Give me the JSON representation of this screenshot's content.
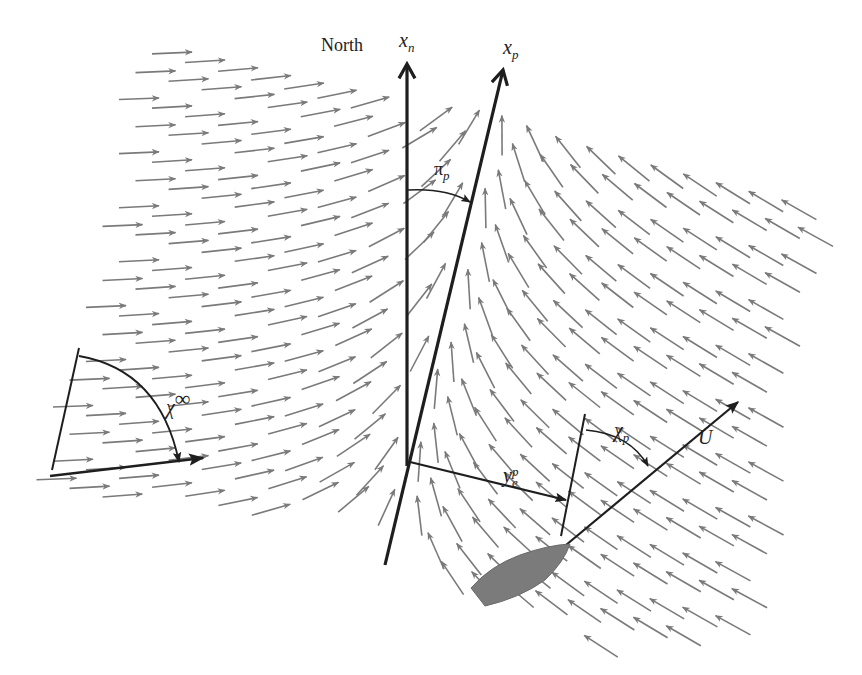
{
  "figure": {
    "width": 862,
    "height": 675,
    "colors": {
      "field_arrow": "#7a7a7a",
      "axis": "#1e1e1e",
      "vessel": "#7b7b7b",
      "background": "#ffffff"
    }
  },
  "labels": {
    "north": "North",
    "x_n": {
      "base": "x",
      "sub": "n"
    },
    "x_p": {
      "base": "x",
      "sub": "p"
    },
    "pi_p": {
      "base": "π",
      "sub": "p"
    },
    "chi_inf": {
      "base": "χ",
      "sup": "∞"
    },
    "chi_p": {
      "base": "χ",
      "sub": "p"
    },
    "y_e_p": {
      "base": "y",
      "sub": "e",
      "sup": "p"
    },
    "U": "U"
  },
  "elements": {
    "north_axis": {
      "from": [
        407,
        466
      ],
      "to": [
        407,
        62
      ]
    },
    "path_axis": {
      "from": [
        385,
        565
      ],
      "to": [
        503,
        68
      ]
    },
    "cross_track_arrow": {
      "from": [
        410,
        462
      ],
      "to": [
        566,
        500
      ]
    },
    "vessel_heading_ref": {
      "from": [
        585,
        414
      ],
      "to": [
        561,
        536
      ]
    },
    "velocity_arrow": {
      "from": [
        566,
        545
      ],
      "to": [
        740,
        400
      ]
    },
    "vessel_hull": [
      [
        471,
        588
      ],
      [
        505,
        560
      ],
      [
        548,
        545
      ],
      [
        570,
        544
      ],
      [
        560,
        566
      ],
      [
        536,
        588
      ],
      [
        485,
        606
      ]
    ],
    "inf_ref_line": {
      "from": [
        52,
        470
      ],
      "to": [
        79,
        348
      ]
    },
    "inf_course_arrow": {
      "from": [
        50,
        476
      ],
      "to": [
        205,
        458
      ]
    }
  },
  "field": {
    "description": "Vector field guiding toward path x_p; left side flows right, right side flows up-left",
    "spacing_x": 33,
    "spacing_y": 27,
    "arrow_length": 40
  }
}
